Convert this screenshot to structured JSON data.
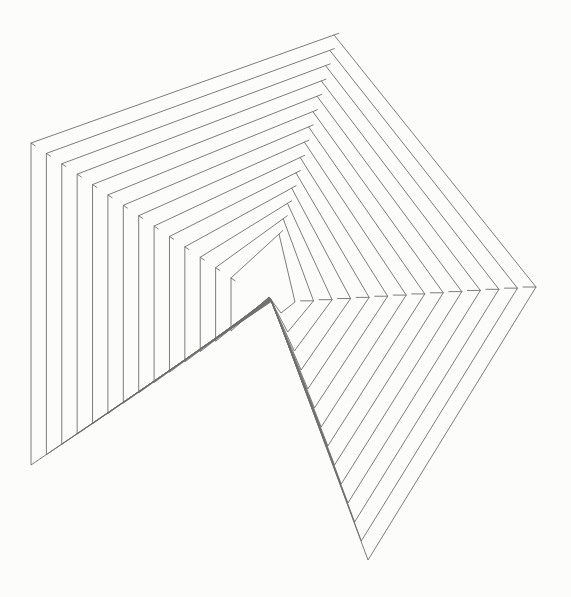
{
  "canvas": {
    "width": 571,
    "height": 597,
    "background_color": "#fcfcfb"
  },
  "drawing": {
    "description": "nested-hexagon-line-spiral",
    "loop_count": 14,
    "stroke_color": "#6e6e6e",
    "stroke_width": 0.9,
    "vertices": {
      "top_apex": {
        "inner": [
          279,
          234
        ],
        "outer": [
          334,
          35
        ]
      },
      "left_top": {
        "inner": [
          231,
          278
        ],
        "outer": [
          31,
          143
        ]
      },
      "left_bottom": {
        "inner": [
          231,
          331
        ],
        "outer": [
          31,
          465
        ]
      },
      "center_notch": {
        "inner": [
          269,
          297
        ],
        "outer": [
          272,
          301
        ]
      },
      "bottom_tip": {
        "inner": [
          281,
          313
        ],
        "outer": [
          368,
          560
        ]
      },
      "right_chevron": {
        "inner": [
          295,
          302
        ],
        "outer": [
          536,
          287
        ]
      }
    },
    "vertex_order": [
      "top_apex",
      "left_top",
      "left_bottom",
      "center_notch",
      "bottom_tip",
      "right_chevron"
    ],
    "chevron_dash": {
      "length": 13,
      "comment": "horizontal connector dash ending at each right-chevron vertex, extending left toward the next inner chevron"
    },
    "apex_overshoot": {
      "length": 5,
      "comment": "short stub continuing the upper-left edge past each top apex"
    },
    "left_corner_tick": {
      "length": 5,
      "direction": [
        0.829,
        0.559
      ],
      "comment": "short stub pointing down-right (toward next inner corner) at each upper-left corner"
    }
  }
}
